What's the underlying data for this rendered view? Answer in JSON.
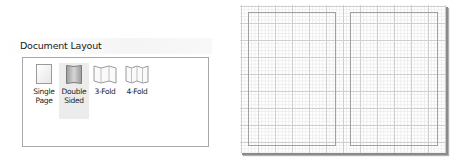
{
  "document_layout": {
    "title": "Document Layout",
    "options": [
      {
        "id": "single-page",
        "label": "Single\nPage",
        "icon": "single-page-icon",
        "selected": false
      },
      {
        "id": "double-sided",
        "label": "Double\nSided",
        "icon": "double-sided-icon",
        "selected": true
      },
      {
        "id": "3-fold",
        "label": "3-Fold",
        "icon": "three-fold-icon",
        "selected": false
      },
      {
        "id": "4-fold",
        "label": "4-Fold",
        "icon": "four-fold-icon",
        "selected": false
      }
    ]
  },
  "preview": {
    "layout": "double-sided",
    "pages": 2,
    "grid": true,
    "colors": {
      "major_grid": "#cfcfcf",
      "minor_grid": "#ededed",
      "page_outline": "#a0a0a0",
      "shadow": "#8a8a8a"
    }
  }
}
